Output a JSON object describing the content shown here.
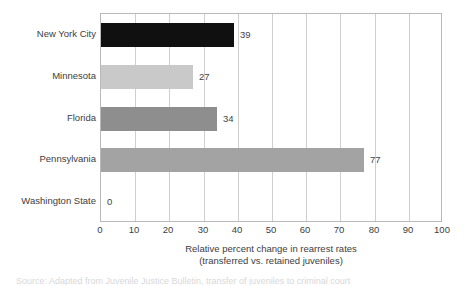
{
  "chart_data": {
    "type": "bar",
    "orientation": "horizontal",
    "title": "",
    "xlabel": "Relative percent change in rearrest rates (transferred vs. retained juveniles)",
    "xlabel_lines": [
      "Relative percent change in rearrest rates",
      "(transferred vs. retained juveniles)"
    ],
    "ylabel": "",
    "categories": [
      "New York City",
      "Minnesota",
      "Florida",
      "Pennsylvania",
      "Washington State"
    ],
    "values": [
      39,
      27,
      34,
      77,
      0
    ],
    "value_labels": [
      "39",
      "27",
      "34",
      "77",
      "0"
    ],
    "bar_colors": [
      "#101010",
      "#c9c9c9",
      "#8e8e8e",
      "#a3a3a3",
      "#ffffff"
    ],
    "xlim": [
      0,
      100
    ],
    "xticks": [
      0,
      10,
      20,
      30,
      40,
      50,
      60,
      70,
      80,
      90,
      100
    ],
    "xtick_labels": [
      "0",
      "10",
      "20",
      "30",
      "40",
      "50",
      "60",
      "70",
      "80",
      "90",
      "100"
    ],
    "grid": "vertical",
    "legend": "none",
    "frame_color": "#b9b9b9",
    "gridline_color": "#cfcfcf",
    "text_color": "#3d3d3d",
    "background": "#ffffff"
  },
  "footer": {
    "caption_clipped": "Source: Adapted from Juvenile Justice Bulletin, transfer of juveniles to criminal court"
  }
}
